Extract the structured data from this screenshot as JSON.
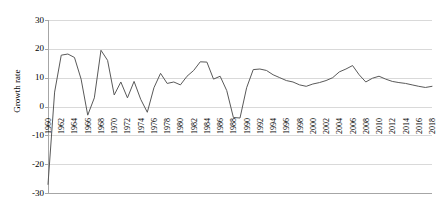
{
  "chart_data": {
    "type": "line",
    "title": "",
    "xlabel": "",
    "ylabel": "Growth rate",
    "ylim": [
      -30,
      30
    ],
    "xlim": [
      1960,
      2018
    ],
    "grid": true,
    "legend": false,
    "line_color": "#595959",
    "gridline_color": "#d9d9d9",
    "axis_color": "#a6a6a6",
    "ytick_labels": [
      "30",
      "20",
      "10",
      "0",
      "-10",
      "-20",
      "-30"
    ],
    "ytick_values": [
      30,
      20,
      10,
      0,
      -10,
      -20,
      -30
    ],
    "xtick_labels": [
      "1960",
      "1962",
      "1964",
      "1966",
      "1968",
      "1970",
      "1972",
      "1974",
      "1976",
      "1978",
      "1980",
      "1982",
      "1984",
      "1986",
      "1988",
      "1990",
      "1992",
      "1994",
      "1996",
      "1998",
      "2000",
      "2002",
      "2004",
      "2006",
      "2008",
      "2010",
      "2012",
      "2014",
      "2016",
      "2018"
    ],
    "xtick_values": [
      1960,
      1962,
      1964,
      1966,
      1968,
      1970,
      1972,
      1974,
      1976,
      1978,
      1980,
      1982,
      1984,
      1986,
      1988,
      1990,
      1992,
      1994,
      1996,
      1998,
      2000,
      2002,
      2004,
      2006,
      2008,
      2010,
      2012,
      2014,
      2016,
      2018
    ],
    "x": [
      1960,
      1961,
      1962,
      1963,
      1964,
      1965,
      1966,
      1967,
      1968,
      1969,
      1970,
      1971,
      1972,
      1973,
      1974,
      1975,
      1976,
      1977,
      1978,
      1979,
      1980,
      1981,
      1982,
      1983,
      1984,
      1985,
      1986,
      1987,
      1988,
      1989,
      1990,
      1991,
      1992,
      1993,
      1994,
      1995,
      1996,
      1997,
      1998,
      1999,
      2000,
      2001,
      2002,
      2003,
      2004,
      2005,
      2006,
      2007,
      2008,
      2009,
      2010,
      2011,
      2012,
      2013,
      2014,
      2015,
      2016,
      2017,
      2018
    ],
    "values": [
      -27.0,
      5.0,
      17.8,
      18.2,
      17.0,
      9.5,
      -3.0,
      3.0,
      19.5,
      16.0,
      4.0,
      8.5,
      3.0,
      8.7,
      2.5,
      -2.0,
      6.5,
      11.5,
      8.0,
      8.5,
      7.5,
      10.5,
      12.5,
      15.5,
      15.4,
      9.5,
      10.5,
      5.5,
      -3.8,
      -4.0,
      6.5,
      12.8,
      13.0,
      12.5,
      11.0,
      10.0,
      9.0,
      8.5,
      7.5,
      7.0,
      7.8,
      8.3,
      9.0,
      10.0,
      12.0,
      13.0,
      14.2,
      11.0,
      8.5,
      9.8,
      10.5,
      9.5,
      8.7,
      8.3,
      8.0,
      7.5,
      7.0,
      6.6,
      7.0
    ]
  },
  "axis": {
    "y_title": "Growth rate"
  }
}
